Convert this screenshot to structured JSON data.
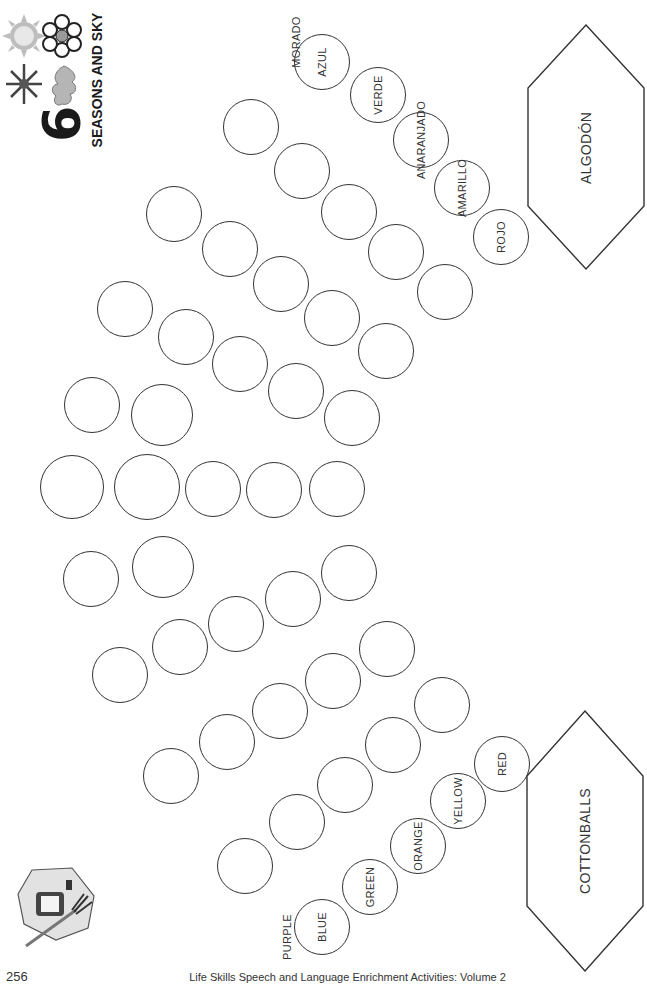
{
  "header": {
    "chapter_number": "6",
    "title": "SEASONS AND SKY",
    "icons": [
      "sun-icon",
      "flower-icon",
      "snowflake-icon",
      "oak-leaf-icon"
    ]
  },
  "spanish_panel": {
    "hexagon_label": "ALGODÓN",
    "color_words": [
      "MORADO",
      "AZUL",
      "VERDE",
      "ANARANJADO",
      "AMARILLO",
      "ROJO"
    ]
  },
  "english_panel": {
    "hexagon_label": "COTTONBALLS",
    "color_words": [
      "PURPLE",
      "BLUE",
      "GREEN",
      "ORANGE",
      "YELLOW",
      "RED"
    ]
  },
  "corner_icon": "glue-and-paintbrush-icon",
  "footer": {
    "page_number": "256",
    "book_title": "Life Skills Speech and Language Enrichment Activities: Volume 2"
  },
  "circles": {
    "labeled_top": [
      {
        "label": "AZUL",
        "x": 322,
        "y": 62,
        "d": 56
      },
      {
        "label": "VERDE",
        "x": 378,
        "y": 95,
        "d": 56
      },
      {
        "label": "ANARANJADO",
        "x": 421,
        "y": 140,
        "d": 56
      },
      {
        "label": "AMARILLO",
        "x": 462,
        "y": 188,
        "d": 56
      },
      {
        "label": "ROJO",
        "x": 501,
        "y": 237,
        "d": 56
      }
    ],
    "labeled_bottom": [
      {
        "label": "BLUE",
        "x": 322,
        "y": 927,
        "d": 56
      },
      {
        "label": "GREEN",
        "x": 370,
        "y": 887,
        "d": 56
      },
      {
        "label": "ORANGE",
        "x": 418,
        "y": 846,
        "d": 56
      },
      {
        "label": "YELLOW",
        "x": 458,
        "y": 801,
        "d": 56
      },
      {
        "label": "RED",
        "x": 502,
        "y": 764,
        "d": 56
      }
    ],
    "blank": [
      {
        "x": 251,
        "y": 127,
        "d": 56
      },
      {
        "x": 302,
        "y": 171,
        "d": 56
      },
      {
        "x": 349,
        "y": 212,
        "d": 56
      },
      {
        "x": 396,
        "y": 252,
        "d": 56
      },
      {
        "x": 445,
        "y": 292,
        "d": 56
      },
      {
        "x": 174,
        "y": 214,
        "d": 56
      },
      {
        "x": 230,
        "y": 249,
        "d": 56
      },
      {
        "x": 281,
        "y": 284,
        "d": 56
      },
      {
        "x": 332,
        "y": 318,
        "d": 56
      },
      {
        "x": 386,
        "y": 351,
        "d": 56
      },
      {
        "x": 125,
        "y": 309,
        "d": 56
      },
      {
        "x": 186,
        "y": 337,
        "d": 56
      },
      {
        "x": 240,
        "y": 364,
        "d": 56
      },
      {
        "x": 296,
        "y": 391,
        "d": 56
      },
      {
        "x": 352,
        "y": 418,
        "d": 56
      },
      {
        "x": 92,
        "y": 405,
        "d": 56
      },
      {
        "x": 162,
        "y": 415,
        "d": 62
      },
      {
        "x": 72,
        "y": 487,
        "d": 64
      },
      {
        "x": 147,
        "y": 487,
        "d": 66
      },
      {
        "x": 213,
        "y": 489,
        "d": 56
      },
      {
        "x": 274,
        "y": 490,
        "d": 56
      },
      {
        "x": 337,
        "y": 489,
        "d": 56
      },
      {
        "x": 91,
        "y": 579,
        "d": 56
      },
      {
        "x": 163,
        "y": 567,
        "d": 62
      },
      {
        "x": 120,
        "y": 675,
        "d": 56
      },
      {
        "x": 180,
        "y": 647,
        "d": 56
      },
      {
        "x": 236,
        "y": 624,
        "d": 56
      },
      {
        "x": 293,
        "y": 599,
        "d": 56
      },
      {
        "x": 349,
        "y": 573,
        "d": 56
      },
      {
        "x": 171,
        "y": 776,
        "d": 56
      },
      {
        "x": 227,
        "y": 742,
        "d": 56
      },
      {
        "x": 280,
        "y": 711,
        "d": 56
      },
      {
        "x": 333,
        "y": 681,
        "d": 56
      },
      {
        "x": 387,
        "y": 649,
        "d": 56
      },
      {
        "x": 245,
        "y": 866,
        "d": 56
      },
      {
        "x": 297,
        "y": 822,
        "d": 56
      },
      {
        "x": 345,
        "y": 785,
        "d": 56
      },
      {
        "x": 393,
        "y": 745,
        "d": 56
      },
      {
        "x": 442,
        "y": 705,
        "d": 56
      }
    ]
  }
}
